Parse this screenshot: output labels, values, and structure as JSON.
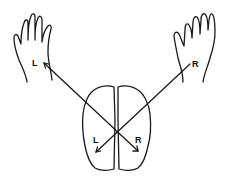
{
  "diagram": {
    "left_hand": {
      "label": "L"
    },
    "right_hand": {
      "label": "R"
    },
    "brain": {
      "left_hemisphere_label": "L",
      "right_hemisphere_label": "R"
    },
    "connections": [
      {
        "from": "left-hand",
        "to": "right-hemisphere"
      },
      {
        "from": "right-hand",
        "to": "left-hemisphere"
      }
    ],
    "colors": {
      "ink": "#1a1a1a",
      "background": "#ffffff"
    }
  }
}
